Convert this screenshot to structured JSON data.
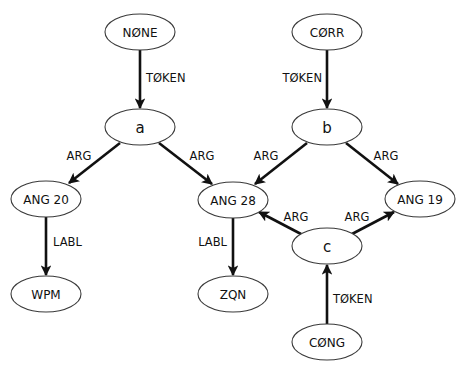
{
  "diagram": {
    "type": "directed-graph",
    "background": "#ffffff",
    "node_stroke_color": "#3a3a3a",
    "edge_color": "#111111",
    "nodes": [
      {
        "id": "none",
        "label": "NØNE",
        "cx": 140,
        "cy": 32,
        "rx": 35,
        "ry": 18
      },
      {
        "id": "corr",
        "label": "CØRR",
        "cx": 327,
        "cy": 32,
        "rx": 35,
        "ry": 18
      },
      {
        "id": "a",
        "label": "a",
        "cx": 140,
        "cy": 127,
        "rx": 35,
        "ry": 18
      },
      {
        "id": "b",
        "label": "b",
        "cx": 327,
        "cy": 127,
        "rx": 35,
        "ry": 18
      },
      {
        "id": "ang20",
        "label": "ANG 20",
        "cx": 46,
        "cy": 199,
        "rx": 35,
        "ry": 18
      },
      {
        "id": "ang28",
        "label": "ANG 28",
        "cx": 233,
        "cy": 200,
        "rx": 35,
        "ry": 18
      },
      {
        "id": "ang19",
        "label": "ANG 19",
        "cx": 420,
        "cy": 199,
        "rx": 35,
        "ry": 18
      },
      {
        "id": "c",
        "label": "c",
        "cx": 327,
        "cy": 246,
        "rx": 35,
        "ry": 18
      },
      {
        "id": "wpm",
        "label": "WPM",
        "cx": 46,
        "cy": 294,
        "rx": 35,
        "ry": 18
      },
      {
        "id": "zqn",
        "label": "ZQN",
        "cx": 233,
        "cy": 294,
        "rx": 35,
        "ry": 18
      },
      {
        "id": "cong",
        "label": "CØNG",
        "cx": 327,
        "cy": 342,
        "rx": 35,
        "ry": 18
      }
    ],
    "edges": [
      {
        "from": "none",
        "to": "a",
        "label": "TØKEN",
        "x1": 140,
        "y1": 50,
        "x2": 140,
        "y2": 108,
        "lx": 146,
        "ly": 78,
        "anchor": "start"
      },
      {
        "from": "corr",
        "to": "b",
        "label": "TØKEN",
        "x1": 327,
        "y1": 50,
        "x2": 327,
        "y2": 108,
        "lx": 322,
        "ly": 78,
        "anchor": "end"
      },
      {
        "from": "a",
        "to": "ang20",
        "label": "ARG",
        "x1": 120,
        "y1": 143,
        "x2": 69,
        "y2": 183,
        "lx": 79,
        "ly": 156,
        "anchor": "middle"
      },
      {
        "from": "a",
        "to": "ang28",
        "label": "ARG",
        "x1": 159,
        "y1": 143,
        "x2": 212,
        "y2": 184,
        "lx": 202,
        "ly": 156,
        "anchor": "middle"
      },
      {
        "from": "b",
        "to": "ang28",
        "label": "ARG",
        "x1": 307,
        "y1": 143,
        "x2": 255,
        "y2": 184,
        "lx": 266,
        "ly": 156,
        "anchor": "middle"
      },
      {
        "from": "b",
        "to": "ang19",
        "label": "ARG",
        "x1": 346,
        "y1": 143,
        "x2": 398,
        "y2": 184,
        "lx": 386,
        "ly": 156,
        "anchor": "middle"
      },
      {
        "from": "ang20",
        "to": "wpm",
        "label": "LABL",
        "x1": 46,
        "y1": 217,
        "x2": 46,
        "y2": 275,
        "lx": 53,
        "ly": 242,
        "anchor": "start"
      },
      {
        "from": "ang28",
        "to": "zqn",
        "label": "LABL",
        "x1": 233,
        "y1": 218,
        "x2": 233,
        "y2": 275,
        "lx": 227,
        "ly": 242,
        "anchor": "end"
      },
      {
        "from": "c",
        "to": "ang28",
        "label": "ARG",
        "x1": 301,
        "y1": 234,
        "x2": 259,
        "y2": 212,
        "lx": 296,
        "ly": 217,
        "anchor": "middle"
      },
      {
        "from": "c",
        "to": "ang19",
        "label": "ARG",
        "x1": 352,
        "y1": 234,
        "x2": 394,
        "y2": 212,
        "lx": 357,
        "ly": 217,
        "anchor": "middle"
      },
      {
        "from": "cong",
        "to": "c",
        "label": "TØKEN",
        "x1": 327,
        "y1": 324,
        "x2": 327,
        "y2": 265,
        "lx": 333,
        "ly": 299,
        "anchor": "start"
      }
    ]
  }
}
